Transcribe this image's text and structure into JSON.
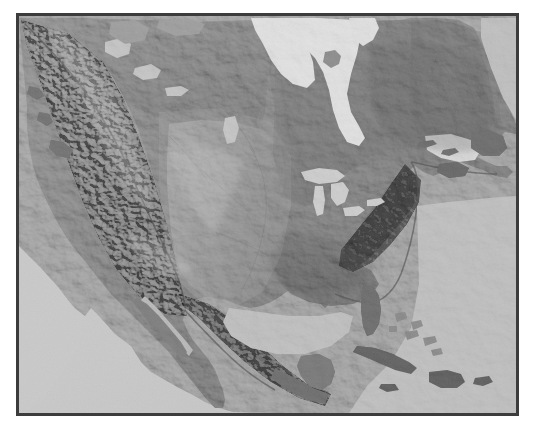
{
  "document": {
    "type": "relief-map-image",
    "title": "North America Shaded Relief Map",
    "caption": ""
  },
  "frame": {
    "border_color": "#3c3c3c",
    "border_width_px": 3,
    "left": 16,
    "top": 13,
    "width": 503,
    "height": 403
  },
  "page": {
    "background_color": "#ffffff",
    "width": 537,
    "height": 429
  },
  "map": {
    "projection_hint": "conic",
    "style": "grayscale-shaded-relief",
    "colors": {
      "ocean": "#c9c9c9",
      "inland_water_light": "#efefef",
      "lowland": "#7d7d7d",
      "midland": "#9b9b9b",
      "highland": "#c4c4c4",
      "peaks": "#e2e2e2",
      "dark_relief": "#4a4a4a",
      "coast_shadow": "#3e3e3e"
    },
    "water_bodies": [
      {
        "name": "Hudson Bay",
        "tone": "#efefef"
      },
      {
        "name": "Foxe Basin",
        "tone": "#eeeeee"
      },
      {
        "name": "Gulf of Saint Lawrence",
        "tone": "#e9e9e9"
      },
      {
        "name": "Great Lakes",
        "tone": "#d8d8d8"
      },
      {
        "name": "Great Bear Lake",
        "tone": "#d5d5d5"
      },
      {
        "name": "Great Slave Lake",
        "tone": "#d5d5d5"
      },
      {
        "name": "Lake Winnipeg",
        "tone": "#d6d6d6"
      },
      {
        "name": "Gulf of Mexico",
        "tone": "#c9c9c9"
      },
      {
        "name": "Pacific Ocean",
        "tone": "#c9c9c9"
      },
      {
        "name": "Atlantic Ocean",
        "tone": "#c9c9c9"
      },
      {
        "name": "Caribbean Sea",
        "tone": "#c9c9c9"
      }
    ],
    "landforms": [
      {
        "name": "Rocky Mountains",
        "relief": "high"
      },
      {
        "name": "Sierra Nevada",
        "relief": "high"
      },
      {
        "name": "Cascade Range",
        "relief": "high"
      },
      {
        "name": "Coast Mountains",
        "relief": "high"
      },
      {
        "name": "Great Basin",
        "relief": "medium"
      },
      {
        "name": "Colorado Plateau",
        "relief": "medium"
      },
      {
        "name": "Great Plains",
        "relief": "medium"
      },
      {
        "name": "Canadian Shield",
        "relief": "low"
      },
      {
        "name": "Appalachian Mountains",
        "relief": "medium"
      },
      {
        "name": "Sierra Madre Occidental",
        "relief": "high"
      },
      {
        "name": "Sierra Madre Oriental",
        "relief": "high"
      },
      {
        "name": "Yucatan Peninsula",
        "relief": "low"
      },
      {
        "name": "Baja California",
        "relief": "medium"
      },
      {
        "name": "Florida Peninsula",
        "relief": "low"
      },
      {
        "name": "Labrador Peninsula",
        "relief": "medium"
      },
      {
        "name": "Newfoundland",
        "relief": "medium"
      },
      {
        "name": "Cuba",
        "relief": "low"
      },
      {
        "name": "Hispaniola",
        "relief": "medium"
      },
      {
        "name": "Jamaica",
        "relief": "low"
      },
      {
        "name": "Bahamas",
        "relief": "low"
      }
    ]
  }
}
